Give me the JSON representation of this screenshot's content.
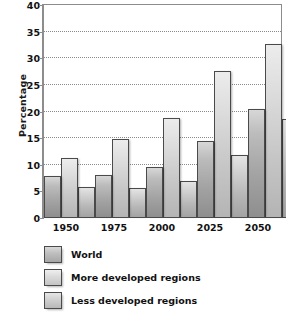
{
  "chart_data": {
    "type": "bar",
    "title": "",
    "subtitle": "",
    "xlabel": "",
    "ylabel": "Percentage",
    "categories": [
      "1950",
      "1975",
      "2000",
      "2025",
      "2050"
    ],
    "series": [
      {
        "name": "World",
        "values": [
          7.8,
          8.0,
          9.5,
          14.4,
          20.4
        ]
      },
      {
        "name": "More developed regions",
        "values": [
          11.2,
          14.9,
          18.8,
          27.6,
          32.6
        ]
      },
      {
        "name": "Less developed regions",
        "values": [
          5.8,
          5.6,
          7.0,
          11.8,
          18.6
        ]
      }
    ],
    "ylim": [
      0,
      40
    ],
    "yticks": [
      0,
      5,
      10,
      15,
      20,
      25,
      30,
      35,
      40
    ],
    "ytick_labels": [
      "0",
      "5",
      "10",
      "15",
      "20",
      "25",
      "30",
      "35",
      "40"
    ],
    "grid": "horizontal-dotted",
    "legend_position": "below-plot",
    "bar_style": "grouped-gradient-gray",
    "colors": {
      "series_world": "#a8a8a8",
      "series_more_developed": "#d5d5d5",
      "series_less_developed": "#c4c4c4",
      "gridline": "#8a8a8a",
      "axis": "#8d8d8d",
      "text": "#111111",
      "background": "#ffffff"
    }
  }
}
